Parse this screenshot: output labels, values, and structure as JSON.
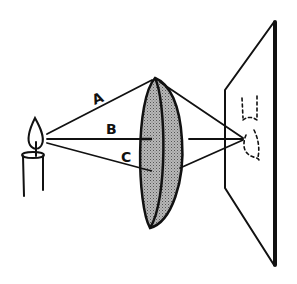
{
  "diagram": {
    "labels": {
      "ray_a": "A",
      "ray_b": "B",
      "ray_c": "C"
    },
    "colors": {
      "ink": "#111111",
      "lens_fill": "#9a9a9a",
      "background": "#ffffff"
    }
  }
}
